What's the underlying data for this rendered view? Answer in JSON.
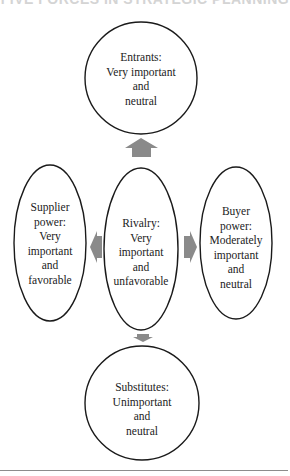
{
  "header": {
    "title": "FIVE FORCES IN STRATEGIC PLANNING"
  },
  "forces": {
    "entrants": {
      "lines": [
        "Entrants:",
        "Very important",
        "and",
        "neutral"
      ]
    },
    "supplier": {
      "lines": [
        "Supplier",
        "power:",
        "Very",
        "important",
        "and",
        "favorable"
      ]
    },
    "rivalry": {
      "lines": [
        "Rivalry:",
        "Very",
        "important",
        "and",
        "unfavorable"
      ]
    },
    "buyer": {
      "lines": [
        "Buyer",
        "power:",
        "Moderately",
        "important",
        "and",
        "neutral"
      ]
    },
    "substitutes": {
      "lines": [
        "Substitutes:",
        "Unimportant",
        "and",
        "neutral"
      ]
    }
  },
  "colors": {
    "outline": "#1a1a1a",
    "arrow": "#8a8a8a",
    "rule": "#8c8c8c"
  }
}
